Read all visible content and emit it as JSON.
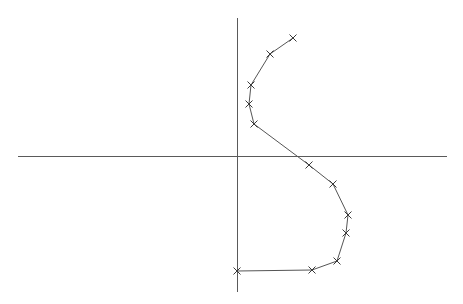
{
  "chart_data": {
    "type": "line",
    "title": "",
    "subtitle": "",
    "xlabel": "",
    "ylabel": "",
    "grid": false,
    "legend": null,
    "marker": "x",
    "marker_size_px": 5,
    "line_color": "#555555",
    "marker_color": "#3a3a3a",
    "axis_color": "#5a5a5a",
    "background_color": "#ffffff",
    "axes": {
      "style": "crosshair-origin",
      "origin_px": {
        "x": 237,
        "y": 156
      },
      "x_axis_px": {
        "x1": 18,
        "y1": 156,
        "x2": 447,
        "y2": 156
      },
      "y_axis_px": {
        "x1": 237,
        "y1": 18,
        "x2": 237,
        "y2": 292
      },
      "tick_labels_x": [],
      "tick_labels_y": [],
      "xlim_px": [
        18,
        447
      ],
      "ylim_px": [
        18,
        292
      ]
    },
    "points_px": [
      {
        "x": 293,
        "y": 38
      },
      {
        "x": 270,
        "y": 54
      },
      {
        "x": 251,
        "y": 85
      },
      {
        "x": 249,
        "y": 104
      },
      {
        "x": 254,
        "y": 124
      },
      {
        "x": 309,
        "y": 165
      },
      {
        "x": 333,
        "y": 184
      },
      {
        "x": 348,
        "y": 215
      },
      {
        "x": 346,
        "y": 233
      },
      {
        "x": 337,
        "y": 261
      },
      {
        "x": 312,
        "y": 270
      },
      {
        "x": 237,
        "y": 271
      }
    ],
    "points_data": [
      {
        "x": 56,
        "y": 118
      },
      {
        "x": 33,
        "y": 102
      },
      {
        "x": 14,
        "y": 71
      },
      {
        "x": 12,
        "y": 52
      },
      {
        "x": 17,
        "y": 32
      },
      {
        "x": 72,
        "y": -9
      },
      {
        "x": 96,
        "y": -28
      },
      {
        "x": 111,
        "y": -59
      },
      {
        "x": 109,
        "y": -77
      },
      {
        "x": 100,
        "y": -105
      },
      {
        "x": 75,
        "y": -114
      },
      {
        "x": 0,
        "y": -115
      }
    ],
    "n_points": 12
  }
}
